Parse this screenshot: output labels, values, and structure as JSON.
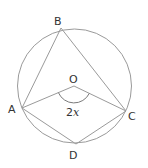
{
  "diagram": {
    "type": "circle-geometry",
    "colors": {
      "stroke": "#9a9a9a",
      "text": "#333333",
      "background": "#ffffff"
    },
    "circle": {
      "cx": 74.5,
      "cy": 86,
      "r": 57
    },
    "points": {
      "A": {
        "label": "A",
        "x": 22,
        "y": 108
      },
      "B": {
        "label": "B",
        "x": 61,
        "y": 28
      },
      "C": {
        "label": "C",
        "x": 126,
        "y": 111
      },
      "D": {
        "label": "D",
        "x": 76,
        "y": 144
      },
      "O": {
        "label": "O",
        "x": 74,
        "y": 86
      }
    },
    "angle_label": {
      "prefix": "2",
      "var": "x"
    }
  }
}
